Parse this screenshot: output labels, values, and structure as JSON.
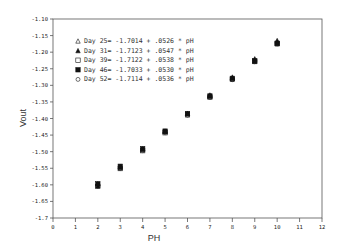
{
  "chart_data": {
    "type": "scatter",
    "title": "",
    "xlabel": "PH",
    "ylabel": "Vout",
    "xlim": [
      0,
      12
    ],
    "ylim": [
      -1.7,
      -1.1
    ],
    "x_ticks": [
      "0",
      "1",
      "2",
      "3",
      "4",
      "5",
      "6",
      "7",
      "8",
      "9",
      "10",
      "11",
      "12"
    ],
    "y_ticks": [
      "-1.10",
      "-1.15",
      "-1.20",
      "-1.25",
      "-1.30",
      "-1.35",
      "-1.40",
      "-1.45",
      "-1.50",
      "-1.55",
      "-1.60",
      "-1.65",
      "-1.7"
    ],
    "grid": false,
    "legend_position": "upper-left",
    "x": [
      2,
      3,
      4,
      5,
      6,
      7,
      8,
      9,
      10
    ],
    "series": [
      {
        "name": "Day 25= -1.7014 + .0526 * pH",
        "marker": "triangle-open",
        "intercept": -1.7014,
        "slope": 0.0526,
        "values": [
          -1.596,
          -1.544,
          -1.491,
          -1.438,
          -1.386,
          -1.333,
          -1.28,
          -1.228,
          -1.175
        ]
      },
      {
        "name": "Day 31= -1.7123 + .0547 * pH",
        "marker": "triangle-filled",
        "intercept": -1.7123,
        "slope": 0.0547,
        "values": [
          -1.603,
          -1.548,
          -1.493,
          -1.439,
          -1.384,
          -1.329,
          -1.275,
          -1.22,
          -1.165
        ]
      },
      {
        "name": "Day 39= -1.7122 + .0538 * pH",
        "marker": "square-open",
        "intercept": -1.7122,
        "slope": 0.0538,
        "values": [
          -1.605,
          -1.551,
          -1.497,
          -1.443,
          -1.389,
          -1.336,
          -1.282,
          -1.228,
          -1.174
        ]
      },
      {
        "name": "Day 46= -1.7033 + .0530 * pH",
        "marker": "square-filled",
        "intercept": -1.7033,
        "slope": 0.053,
        "values": [
          -1.597,
          -1.544,
          -1.491,
          -1.438,
          -1.385,
          -1.332,
          -1.279,
          -1.226,
          -1.173
        ]
      },
      {
        "name": "Day 52= -1.7114 + .0536 * pH",
        "marker": "circle-open",
        "intercept": -1.7114,
        "slope": 0.0536,
        "values": [
          -1.604,
          -1.551,
          -1.497,
          -1.443,
          -1.39,
          -1.336,
          -1.283,
          -1.229,
          -1.175
        ]
      }
    ]
  },
  "legend": [
    {
      "label": "Day 25= -1.7014 + .0526 * pH",
      "marker": "triangle-open-icon"
    },
    {
      "label": "Day 31= -1.7123 + .0547 * pH",
      "marker": "triangle-filled-icon"
    },
    {
      "label": "Day 39= -1.7122 + .0538 * pH",
      "marker": "square-open-icon"
    },
    {
      "label": "Day 46= -1.7033 + .0530 * pH",
      "marker": "square-filled-icon"
    },
    {
      "label": "Day 52= -1.7114 + .0536 * pH",
      "marker": "circle-open-icon"
    }
  ],
  "colors": {
    "axis": "#555555",
    "marker": "#111111",
    "text": "#333333"
  }
}
